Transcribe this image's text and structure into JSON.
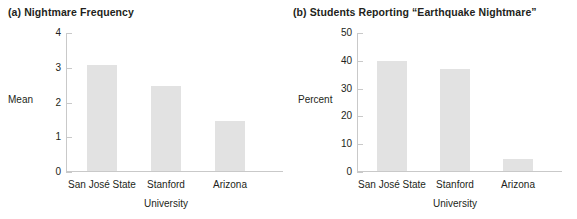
{
  "figure": {
    "panels": [
      {
        "key": "a",
        "title": "(a) Nightmare Frequency",
        "ylabel": "Mean",
        "xlabel": "University"
      },
      {
        "key": "b",
        "title": "(b) Students Reporting “Earthquake Nightmare”",
        "ylabel": "Percent",
        "xlabel": "University"
      }
    ],
    "bar_color": "#e2e2e2",
    "axis_color": "#c9c9c9",
    "text_color": "#231f20"
  },
  "chart_data": [
    {
      "type": "bar",
      "title": "(a) Nightmare Frequency",
      "xlabel": "University",
      "ylabel": "Mean",
      "categories": [
        "San José State",
        "Stanford",
        "Arizona"
      ],
      "values": [
        3.05,
        2.45,
        1.45
      ],
      "ylim": [
        0,
        4
      ],
      "yticks": [
        0,
        1,
        2,
        3,
        4
      ],
      "ytick_labels": [
        "0",
        "1",
        "2",
        "3",
        "4"
      ],
      "grid": false,
      "legend": "none"
    },
    {
      "type": "bar",
      "title": "(b) Students Reporting “Earthquake Nightmare”",
      "xlabel": "University",
      "ylabel": "Percent",
      "categories": [
        "San José State",
        "Stanford",
        "Arizona"
      ],
      "values": [
        39.7,
        36.8,
        4.3
      ],
      "ylim": [
        0,
        50
      ],
      "yticks": [
        0,
        10,
        20,
        30,
        40,
        50
      ],
      "ytick_labels": [
        "0",
        "10",
        "20",
        "30",
        "40",
        "50"
      ],
      "grid": false,
      "legend": "none"
    }
  ]
}
